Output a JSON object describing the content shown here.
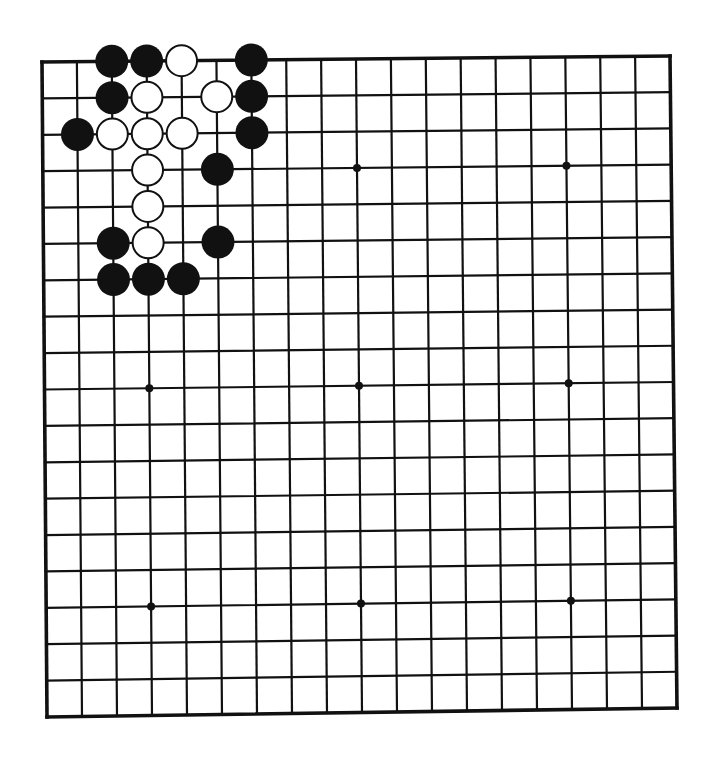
{
  "diagram": {
    "type": "go-board",
    "size": 19,
    "colors": {
      "background": "#ffffff",
      "line": "#111111",
      "black_stone": "#111111",
      "white_stone": "#ffffff"
    },
    "star_points": [
      [
        3,
        3
      ],
      [
        9,
        3
      ],
      [
        15,
        3
      ],
      [
        3,
        9
      ],
      [
        9,
        9
      ],
      [
        15,
        9
      ],
      [
        3,
        15
      ],
      [
        9,
        15
      ],
      [
        15,
        15
      ]
    ],
    "stones": [
      {
        "col": 2,
        "row": 0,
        "color": "black"
      },
      {
        "col": 3,
        "row": 0,
        "color": "black"
      },
      {
        "col": 4,
        "row": 0,
        "color": "white"
      },
      {
        "col": 6,
        "row": 0,
        "color": "black"
      },
      {
        "col": 2,
        "row": 1,
        "color": "black"
      },
      {
        "col": 3,
        "row": 1,
        "color": "white"
      },
      {
        "col": 5,
        "row": 1,
        "color": "white"
      },
      {
        "col": 6,
        "row": 1,
        "color": "black"
      },
      {
        "col": 1,
        "row": 2,
        "color": "black"
      },
      {
        "col": 2,
        "row": 2,
        "color": "white"
      },
      {
        "col": 3,
        "row": 2,
        "color": "white"
      },
      {
        "col": 4,
        "row": 2,
        "color": "white"
      },
      {
        "col": 6,
        "row": 2,
        "color": "black"
      },
      {
        "col": 3,
        "row": 3,
        "color": "white"
      },
      {
        "col": 5,
        "row": 3,
        "color": "black"
      },
      {
        "col": 3,
        "row": 4,
        "color": "white"
      },
      {
        "col": 2,
        "row": 5,
        "color": "black"
      },
      {
        "col": 3,
        "row": 5,
        "color": "white"
      },
      {
        "col": 5,
        "row": 5,
        "color": "black"
      },
      {
        "col": 2,
        "row": 6,
        "color": "black"
      },
      {
        "col": 3,
        "row": 6,
        "color": "black"
      },
      {
        "col": 4,
        "row": 6,
        "color": "black"
      }
    ]
  }
}
